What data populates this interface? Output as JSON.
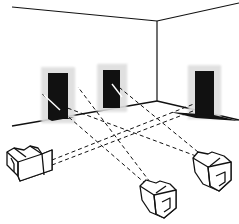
{
  "figure": {
    "colors": {
      "background": "#ffffff",
      "ink": "#111111",
      "halo": "#bdbdbd"
    },
    "room": {
      "ceiling_left": [
        [
          12,
          7
        ],
        [
          157,
          21
        ]
      ],
      "ceiling_right": [
        [
          157,
          21
        ],
        [
          239,
          3
        ]
      ],
      "corner": [
        [
          157,
          21
        ],
        [
          157,
          101
        ]
      ],
      "floor_left": [
        [
          12,
          126
        ],
        [
          157,
          101
        ]
      ],
      "floor_right": [
        [
          157,
          101
        ],
        [
          239,
          120
        ]
      ]
    },
    "doorways": [
      {
        "id": "door-1",
        "x": 48,
        "y": 73,
        "w": 20,
        "h": 46
      },
      {
        "id": "door-2",
        "x": 103,
        "y": 70,
        "w": 17,
        "h": 38
      },
      {
        "id": "door-3",
        "x": 195,
        "y": 71,
        "w": 19,
        "h": 44
      }
    ],
    "devices": [
      {
        "id": "device-left",
        "x": 5,
        "y": 148
      },
      {
        "id": "device-center",
        "x": 140,
        "y": 178
      },
      {
        "id": "device-right",
        "x": 192,
        "y": 150
      }
    ],
    "sight_lines": [
      {
        "from": "device-left",
        "to": "door-3"
      },
      {
        "from": "device-left",
        "to": "door-3b"
      },
      {
        "from": "device-center",
        "to": "door-1"
      },
      {
        "from": "device-center",
        "to": "door-2"
      },
      {
        "from": "device-right",
        "to": "door-1"
      },
      {
        "from": "device-right",
        "to": "door-2"
      }
    ]
  }
}
